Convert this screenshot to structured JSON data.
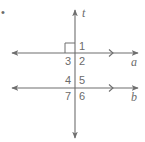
{
  "diagram": {
    "type": "parallel-lines-cut-by-transversal",
    "bullet": "•",
    "transversal": {
      "name": "t",
      "x": 75,
      "y1": 10,
      "y2": 138
    },
    "lines": [
      {
        "name": "a",
        "y": 53,
        "x1": 12,
        "x2": 138,
        "tick_x": 112,
        "label_x": 132,
        "label_y": 66
      },
      {
        "name": "b",
        "y": 88,
        "x1": 12,
        "x2": 138,
        "tick_x": 112,
        "label_x": 132,
        "label_y": 101
      }
    ],
    "right_angle_marker": {
      "at_angle": "3-adjacent upper-left of line a and t",
      "x": 65,
      "y": 43,
      "size": 10
    },
    "angle_labels": [
      {
        "id": "1",
        "text": "1",
        "x": 79,
        "y": 50
      },
      {
        "id": "2",
        "text": "2",
        "x": 79,
        "y": 65
      },
      {
        "id": "3",
        "text": "3",
        "x": 66,
        "y": 65
      },
      {
        "id": "4",
        "text": "4",
        "x": 66,
        "y": 84
      },
      {
        "id": "5",
        "text": "5",
        "x": 79,
        "y": 84
      },
      {
        "id": "6",
        "text": "6",
        "x": 79,
        "y": 100
      },
      {
        "id": "7",
        "text": "7",
        "x": 66,
        "y": 100
      }
    ],
    "colors": {
      "line": "#6e6e6e",
      "text": "#6b6b6b",
      "background": "#ffffff"
    }
  }
}
